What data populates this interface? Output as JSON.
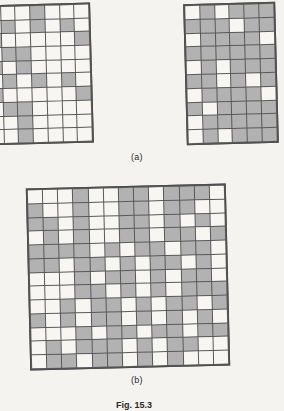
{
  "figure": {
    "fig_number": "Fig. 15.3",
    "panels": [
      {
        "id": "a",
        "caption": "(a)"
      },
      {
        "id": "b",
        "caption": "(b)"
      }
    ]
  },
  "colors": {
    "background": "#f4f3ef",
    "cell_on": "#b2b2b2",
    "cell_off": "#f7f6f3",
    "gridline": "#585858",
    "text": "#2b2b2b"
  },
  "chart_data": {
    "type": "heatmap",
    "title": "Fig. 15.3",
    "xlabel": "",
    "ylabel": "",
    "legend": [
      "0 = white cell",
      "1 = shaded cell"
    ],
    "grids": [
      {
        "name": "panel-a-left",
        "panel": "(a)",
        "position": "left",
        "rows": 10,
        "cols": 7,
        "rotation_deg": -1.6,
        "note": "partially cropped at the left edge of the image",
        "values": [
          [
            0,
            0,
            0,
            1,
            0,
            0,
            0
          ],
          [
            0,
            1,
            0,
            1,
            0,
            1,
            0
          ],
          [
            1,
            0,
            0,
            0,
            0,
            0,
            1
          ],
          [
            0,
            1,
            1,
            0,
            0,
            0,
            0
          ],
          [
            1,
            0,
            1,
            0,
            0,
            0,
            0
          ],
          [
            0,
            1,
            0,
            1,
            0,
            1,
            0
          ],
          [
            1,
            0,
            0,
            0,
            0,
            0,
            1
          ],
          [
            0,
            1,
            1,
            0,
            0,
            0,
            0
          ],
          [
            0,
            0,
            1,
            0,
            0,
            0,
            0
          ],
          [
            0,
            0,
            1,
            0,
            0,
            0,
            0
          ]
        ]
      },
      {
        "name": "panel-a-right",
        "panel": "(a)",
        "position": "right",
        "rows": 10,
        "cols": 6,
        "rotation_deg": -1.5,
        "values": [
          [
            0,
            1,
            0,
            1,
            1,
            1
          ],
          [
            1,
            1,
            1,
            0,
            1,
            1
          ],
          [
            0,
            1,
            1,
            1,
            1,
            0
          ],
          [
            1,
            1,
            1,
            1,
            1,
            1
          ],
          [
            0,
            1,
            0,
            1,
            1,
            1
          ],
          [
            1,
            1,
            0,
            1,
            0,
            1
          ],
          [
            0,
            1,
            1,
            1,
            1,
            0
          ],
          [
            1,
            0,
            1,
            1,
            1,
            1
          ],
          [
            0,
            1,
            1,
            1,
            1,
            1
          ],
          [
            0,
            1,
            0,
            1,
            1,
            1
          ]
        ]
      },
      {
        "name": "panel-b",
        "panel": "(b)",
        "position": "center",
        "rows": 13,
        "cols": 13,
        "rotation_deg": -1.4,
        "values": [
          [
            0,
            0,
            0,
            1,
            0,
            0,
            1,
            1,
            0,
            1,
            1,
            1,
            0
          ],
          [
            1,
            0,
            0,
            1,
            0,
            0,
            1,
            1,
            0,
            1,
            1,
            0,
            0
          ],
          [
            1,
            1,
            0,
            1,
            0,
            0,
            1,
            1,
            0,
            1,
            0,
            1,
            0
          ],
          [
            0,
            1,
            0,
            1,
            0,
            0,
            1,
            1,
            0,
            1,
            1,
            0,
            1
          ],
          [
            1,
            1,
            1,
            1,
            0,
            1,
            0,
            1,
            1,
            0,
            1,
            1,
            0
          ],
          [
            1,
            1,
            0,
            1,
            1,
            0,
            1,
            0,
            1,
            1,
            0,
            1,
            0
          ],
          [
            0,
            0,
            0,
            1,
            0,
            1,
            1,
            0,
            1,
            0,
            1,
            1,
            0
          ],
          [
            0,
            0,
            0,
            1,
            1,
            0,
            1,
            0,
            1,
            0,
            1,
            1,
            1
          ],
          [
            0,
            0,
            1,
            0,
            1,
            1,
            0,
            1,
            0,
            1,
            1,
            0,
            1
          ],
          [
            1,
            0,
            1,
            0,
            1,
            1,
            0,
            1,
            0,
            1,
            0,
            1,
            0
          ],
          [
            0,
            0,
            0,
            1,
            0,
            1,
            1,
            0,
            1,
            1,
            0,
            1,
            1
          ],
          [
            0,
            1,
            0,
            1,
            1,
            1,
            0,
            1,
            0,
            1,
            1,
            0,
            0
          ],
          [
            0,
            1,
            1,
            0,
            1,
            1,
            0,
            1,
            0,
            1,
            0,
            0,
            0
          ]
        ]
      }
    ]
  }
}
